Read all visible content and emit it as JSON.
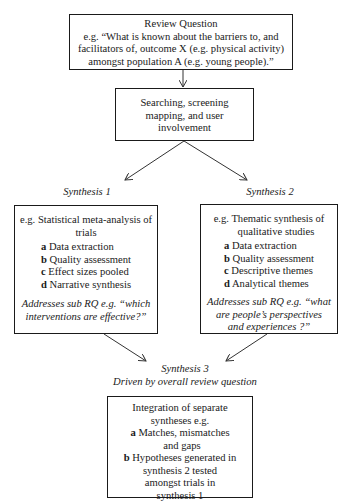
{
  "review_question": {
    "title": "Review Question",
    "lines": [
      "e.g. “What is known about the barriers to, and",
      "facilitators of, outcome X (e.g. physical activity)",
      "amongst population A (e.g. young people).”"
    ]
  },
  "searching": {
    "lines": [
      "Searching, screening",
      "mapping, and user",
      "involvement"
    ]
  },
  "synthesis1": {
    "label": "Synthesis 1",
    "intro_lines": [
      "e.g. Statistical meta-analysis of",
      "trials"
    ],
    "steps": [
      {
        "letter": "a",
        "text": "Data extraction"
      },
      {
        "letter": "b",
        "text": "Quality assessment"
      },
      {
        "letter": "c",
        "text": "Effect sizes pooled"
      },
      {
        "letter": "d",
        "text": "Narrative synthesis"
      }
    ],
    "sub_rq_lines": [
      "Addresses sub RQ e.g. “which",
      "interventions are effective?”"
    ]
  },
  "synthesis2": {
    "label": "Synthesis 2",
    "intro_lines": [
      "e.g. Thematic synthesis of",
      "qualitative studies"
    ],
    "steps": [
      {
        "letter": "a",
        "text": "Data extraction"
      },
      {
        "letter": "b",
        "text": "Quality assessment"
      },
      {
        "letter": "c",
        "text": "Descriptive themes"
      },
      {
        "letter": "d",
        "text": "Analytical themes"
      }
    ],
    "sub_rq_lines": [
      "Addresses sub RQ e.g. “what",
      "are people’s perspectives",
      "and experiences ?”"
    ]
  },
  "synthesis3": {
    "label": "Synthesis 3",
    "sublabel": "Driven by overall review question",
    "intro_lines": [
      "Integration of separate",
      "syntheses e.g."
    ],
    "steps": [
      {
        "letter": "a",
        "lines": [
          "Matches, mismatches",
          "and gaps"
        ]
      },
      {
        "letter": "b",
        "lines": [
          "Hypotheses generated in",
          "synthesis 2 tested",
          "amongst trials in",
          "synthesis 1"
        ]
      }
    ]
  }
}
